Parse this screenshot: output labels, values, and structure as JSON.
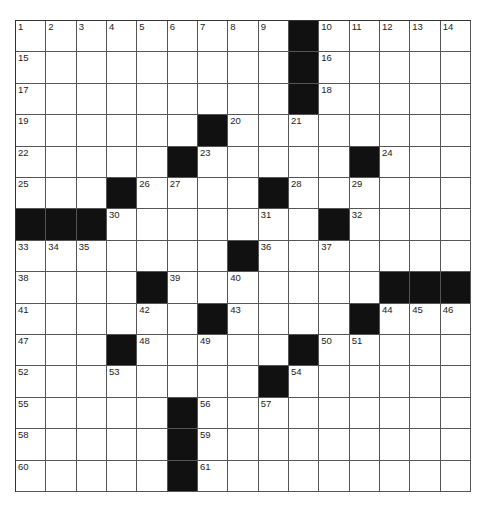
{
  "puzzle": {
    "rows": 15,
    "cols": 15,
    "colors": {
      "black": "#111111",
      "white": "#ffffff",
      "line": "#555555"
    },
    "layout": [
      ".........#.....",
      ".........#.....",
      ".........#.....",
      "......#........",
      ".....#.....#...",
      "...#....#......",
      "###.......#....",
      ".......#.......",
      "....#.......###",
      "......#....#...",
      "...#.....#.....",
      "........#......",
      ".....#.........",
      ".....#.........",
      ".....#........."
    ],
    "numbers": [
      {
        "r": 0,
        "c": 0,
        "n": "1"
      },
      {
        "r": 0,
        "c": 1,
        "n": "2"
      },
      {
        "r": 0,
        "c": 2,
        "n": "3"
      },
      {
        "r": 0,
        "c": 3,
        "n": "4"
      },
      {
        "r": 0,
        "c": 4,
        "n": "5"
      },
      {
        "r": 0,
        "c": 5,
        "n": "6"
      },
      {
        "r": 0,
        "c": 6,
        "n": "7"
      },
      {
        "r": 0,
        "c": 7,
        "n": "8"
      },
      {
        "r": 0,
        "c": 8,
        "n": "9"
      },
      {
        "r": 0,
        "c": 10,
        "n": "10"
      },
      {
        "r": 0,
        "c": 11,
        "n": "11"
      },
      {
        "r": 0,
        "c": 12,
        "n": "12"
      },
      {
        "r": 0,
        "c": 13,
        "n": "13"
      },
      {
        "r": 0,
        "c": 14,
        "n": "14"
      },
      {
        "r": 1,
        "c": 0,
        "n": "15"
      },
      {
        "r": 1,
        "c": 10,
        "n": "16"
      },
      {
        "r": 2,
        "c": 0,
        "n": "17"
      },
      {
        "r": 2,
        "c": 10,
        "n": "18"
      },
      {
        "r": 3,
        "c": 0,
        "n": "19"
      },
      {
        "r": 3,
        "c": 7,
        "n": "20"
      },
      {
        "r": 3,
        "c": 9,
        "n": "21"
      },
      {
        "r": 4,
        "c": 0,
        "n": "22"
      },
      {
        "r": 4,
        "c": 6,
        "n": "23"
      },
      {
        "r": 4,
        "c": 12,
        "n": "24"
      },
      {
        "r": 5,
        "c": 0,
        "n": "25"
      },
      {
        "r": 5,
        "c": 4,
        "n": "26"
      },
      {
        "r": 5,
        "c": 5,
        "n": "27"
      },
      {
        "r": 5,
        "c": 9,
        "n": "28"
      },
      {
        "r": 5,
        "c": 11,
        "n": "29"
      },
      {
        "r": 6,
        "c": 3,
        "n": "30"
      },
      {
        "r": 6,
        "c": 8,
        "n": "31"
      },
      {
        "r": 6,
        "c": 11,
        "n": "32"
      },
      {
        "r": 7,
        "c": 0,
        "n": "33"
      },
      {
        "r": 7,
        "c": 1,
        "n": "34"
      },
      {
        "r": 7,
        "c": 2,
        "n": "35"
      },
      {
        "r": 7,
        "c": 8,
        "n": "36"
      },
      {
        "r": 7,
        "c": 10,
        "n": "37"
      },
      {
        "r": 8,
        "c": 0,
        "n": "38"
      },
      {
        "r": 8,
        "c": 5,
        "n": "39"
      },
      {
        "r": 8,
        "c": 7,
        "n": "40"
      },
      {
        "r": 9,
        "c": 0,
        "n": "41"
      },
      {
        "r": 9,
        "c": 4,
        "n": "42"
      },
      {
        "r": 9,
        "c": 7,
        "n": "43"
      },
      {
        "r": 9,
        "c": 12,
        "n": "44"
      },
      {
        "r": 9,
        "c": 13,
        "n": "45"
      },
      {
        "r": 9,
        "c": 14,
        "n": "46"
      },
      {
        "r": 10,
        "c": 0,
        "n": "47"
      },
      {
        "r": 10,
        "c": 4,
        "n": "48"
      },
      {
        "r": 10,
        "c": 6,
        "n": "49"
      },
      {
        "r": 10,
        "c": 10,
        "n": "50"
      },
      {
        "r": 10,
        "c": 11,
        "n": "51"
      },
      {
        "r": 11,
        "c": 0,
        "n": "52"
      },
      {
        "r": 11,
        "c": 3,
        "n": "53"
      },
      {
        "r": 11,
        "c": 9,
        "n": "54"
      },
      {
        "r": 12,
        "c": 0,
        "n": "55"
      },
      {
        "r": 12,
        "c": 6,
        "n": "56"
      },
      {
        "r": 12,
        "c": 8,
        "n": "57"
      },
      {
        "r": 13,
        "c": 0,
        "n": "58"
      },
      {
        "r": 13,
        "c": 6,
        "n": "59"
      },
      {
        "r": 14,
        "c": 0,
        "n": "60"
      },
      {
        "r": 14,
        "c": 6,
        "n": "61"
      }
    ]
  }
}
